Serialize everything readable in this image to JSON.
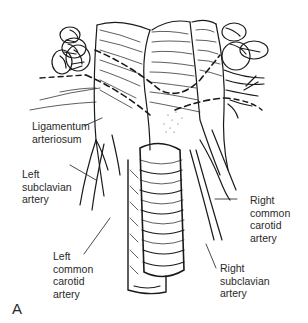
{
  "figure": {
    "panel_letter": "A",
    "labels": {
      "ligamentum_arteriosum": [
        "Ligamentum",
        "arteriosum"
      ],
      "left_subclavian_artery": [
        "Left",
        "subclavian",
        "artery"
      ],
      "left_common_carotid_artery": [
        "Left",
        "common",
        "carotid",
        "artery"
      ],
      "right_common_carotid_artery": [
        "Right",
        "common",
        "carotid",
        "artery"
      ],
      "right_subclavian_artery": [
        "Right",
        "subclavian",
        "artery"
      ]
    },
    "colors": {
      "ink": "#1a1a1a",
      "background": "#ffffff",
      "label_text": "#2a2a2a"
    }
  }
}
